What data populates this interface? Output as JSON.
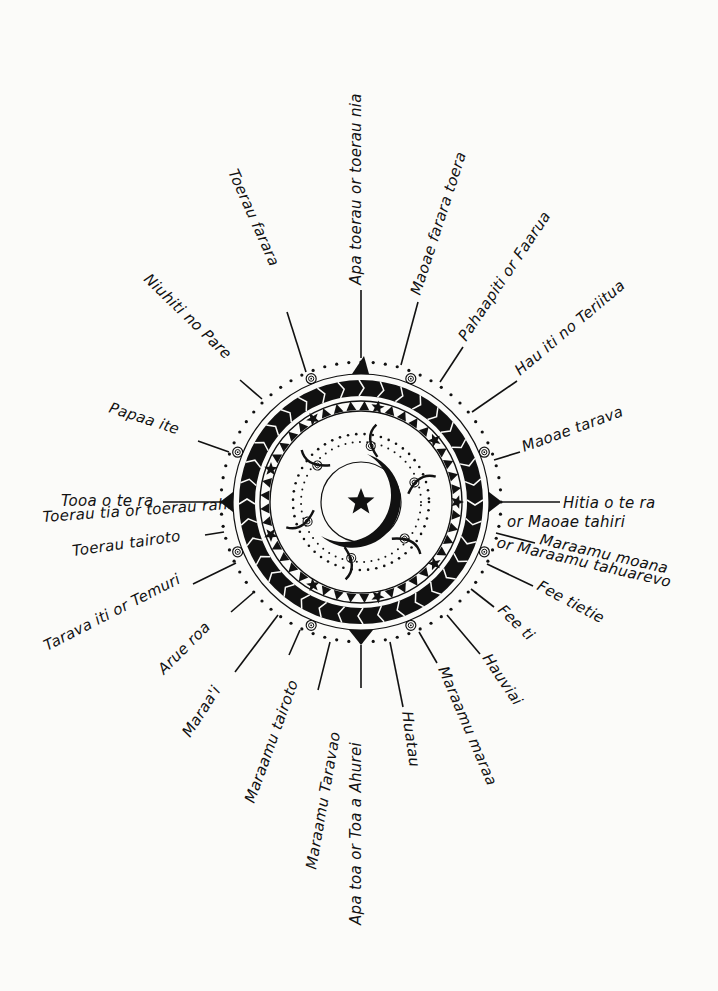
{
  "diagram": {
    "center": {
      "x": 361,
      "y": 502
    },
    "colors": {
      "ink": "#111111",
      "paper": "#fbfbf9"
    },
    "center_symbol": "star-and-crescent",
    "winds": [
      {
        "id": "apa-toerau",
        "label": "Apa toerau or toerau nia",
        "line": [
          361,
          358,
          361,
          290
        ],
        "text": {
          "x": 361,
          "y": 285,
          "rot": -90,
          "anchor": "start"
        }
      },
      {
        "id": "maoae-farara",
        "label": "Maoae farara toera",
        "line": [
          401,
          365,
          418,
          302
        ],
        "text": {
          "x": 420,
          "y": 296,
          "rot": -72,
          "anchor": "start"
        }
      },
      {
        "id": "pahaapiti",
        "label": "Pahaapiti   or  Faarua",
        "line": [
          440,
          382,
          463,
          347
        ],
        "text": {
          "x": 466,
          "y": 342,
          "rot": -56,
          "anchor": "start"
        }
      },
      {
        "id": "hau-iti",
        "label": "Hau iti no Teriitua",
        "line": [
          472,
          412,
          517,
          381
        ],
        "text": {
          "x": 520,
          "y": 376,
          "rot": -40,
          "anchor": "start"
        }
      },
      {
        "id": "maoae-tarava",
        "label": "Maoae tarava",
        "line": [
          494,
          460,
          520,
          452
        ],
        "text": {
          "x": 524,
          "y": 452,
          "rot": -20,
          "anchor": "start"
        }
      },
      {
        "id": "hitia-o-te-ra",
        "label": "Hitia o te ra",
        "label2": "or Maoae tahiri",
        "line": [
          502,
          502,
          560,
          502
        ],
        "text": {
          "x": 563,
          "y": 508,
          "rot": 0,
          "anchor": "start"
        },
        "text2": {
          "x": 507,
          "y": 527,
          "rot": 0,
          "anchor": "start"
        }
      },
      {
        "id": "maraamu-moana",
        "label": "Maraamu moana",
        "label2": "or Maraamu tahuarevo",
        "line": [
          496,
          533,
          535,
          543
        ],
        "text": {
          "x": 539,
          "y": 544,
          "rot": 13,
          "anchor": "start"
        },
        "text2": {
          "x": 496,
          "y": 547,
          "rot": 13,
          "anchor": "start"
        }
      },
      {
        "id": "fee-tietie",
        "label": "Fee tietie",
        "line": [
          487,
          564,
          533,
          586
        ],
        "text": {
          "x": 536,
          "y": 589,
          "rot": 28,
          "anchor": "start"
        }
      },
      {
        "id": "fee-ti",
        "label": "Fee ti",
        "line": [
          471,
          589,
          494,
          607
        ],
        "text": {
          "x": 497,
          "y": 611,
          "rot": 44,
          "anchor": "start"
        }
      },
      {
        "id": "hauviai",
        "label": "Hauviai",
        "line": [
          447,
          615,
          480,
          654
        ],
        "text": {
          "x": 482,
          "y": 658,
          "rot": 56,
          "anchor": "start"
        }
      },
      {
        "id": "maraamu-maraa",
        "label": "Maraamu maraa",
        "line": [
          419,
          632,
          437,
          663
        ],
        "text": {
          "x": 438,
          "y": 669,
          "rot": 67,
          "anchor": "start"
        }
      },
      {
        "id": "huatau",
        "label": "Huatau",
        "line": [
          390,
          642,
          403,
          707
        ],
        "text": {
          "x": 402,
          "y": 712,
          "rot": 82,
          "anchor": "start"
        }
      },
      {
        "id": "apa-toa",
        "label": "Apa toa or Toa a Ahurei",
        "line": [
          361,
          645,
          361,
          688
        ],
        "text": {
          "x": 361,
          "y": 925,
          "rot": -90,
          "anchor": "start"
        }
      },
      {
        "id": "maraamu-taravao",
        "label": "Maraamu  Taravao",
        "line": [
          330,
          642,
          318,
          690
        ],
        "text": {
          "x": 316,
          "y": 870,
          "rot": -80,
          "anchor": "start"
        }
      },
      {
        "id": "maraamu-tairoto",
        "label": "Maraamu tairoto",
        "line": [
          300,
          630,
          289,
          655
        ],
        "text": {
          "x": 254,
          "y": 804,
          "rot": -70,
          "anchor": "start"
        }
      },
      {
        "id": "maraai",
        "label": "Maraa'i",
        "line": [
          278,
          615,
          235,
          672
        ],
        "text": {
          "x": 190,
          "y": 738,
          "rot": -57,
          "anchor": "start"
        }
      },
      {
        "id": "arue-roa",
        "label": "Arue  roa",
        "line": [
          253,
          593,
          231,
          612
        ],
        "text": {
          "x": 164,
          "y": 675,
          "rot": -45,
          "anchor": "start"
        }
      },
      {
        "id": "tarava-iti",
        "label": "Tarava iti or Temuri",
        "line": [
          236,
          563,
          193,
          584
        ],
        "text": {
          "x": 47,
          "y": 651,
          "rot": -27,
          "anchor": "start"
        }
      },
      {
        "id": "toerau-tairoto",
        "label": "Toerau  tairoto",
        "line": [
          224,
          532,
          205,
          535
        ],
        "text": {
          "x": 73,
          "y": 556,
          "rot": -8,
          "anchor": "start"
        }
      },
      {
        "id": "toerau-tia",
        "label": "Toerau tia or toerau rahi",
        "line": [],
        "text": {
          "x": 43,
          "y": 522,
          "rot": -4,
          "anchor": "start"
        }
      },
      {
        "id": "tooa-o-te-ra",
        "label": "Tooa o te ra",
        "line": [
          221,
          502,
          163,
          502
        ],
        "text": {
          "x": 61,
          "y": 506,
          "rot": 0,
          "anchor": "start"
        }
      },
      {
        "id": "papaa-ite",
        "label": "Papaa ite",
        "line": [
          229,
          452,
          198,
          441
        ],
        "text": {
          "x": 108,
          "y": 412,
          "rot": 18,
          "anchor": "start"
        }
      },
      {
        "id": "niuhiti",
        "label": "Niuhiti no Pare",
        "line": [
          262,
          399,
          240,
          380
        ],
        "text": {
          "x": 143,
          "y": 280,
          "rot": 44,
          "anchor": "start"
        }
      },
      {
        "id": "toerau-farara",
        "label": "Toerau farara",
        "line": [
          306,
          372,
          287,
          312
        ],
        "text": {
          "x": 228,
          "y": 172,
          "rot": 66,
          "anchor": "start"
        }
      }
    ]
  }
}
